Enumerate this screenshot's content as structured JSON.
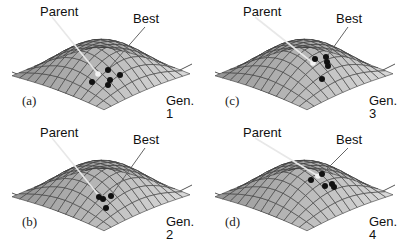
{
  "figure": {
    "panels": [
      {
        "id": "a",
        "tag": "(a)",
        "generation": "Gen. 1",
        "parent_label": "Parent",
        "best_label": "Best",
        "parent_point": [
          98,
          74
        ],
        "best_point": [
          107,
          70
        ],
        "offspring": [
          [
            92,
            82
          ],
          [
            108,
            70
          ],
          [
            110,
            80
          ],
          [
            108,
            85
          ],
          [
            120,
            75
          ]
        ]
      },
      {
        "id": "b",
        "tag": "(b)",
        "generation": "Gen. 2",
        "parent_label": "Parent",
        "best_label": "Best",
        "parent_point": [
          100,
          76
        ],
        "best_point": [
          110,
          75
        ],
        "offspring": [
          [
            99,
            76
          ],
          [
            103,
            78
          ],
          [
            111,
            75
          ],
          [
            106,
            87
          ]
        ]
      },
      {
        "id": "c",
        "tag": "(c)",
        "generation": "Gen. 3",
        "parent_label": "Parent",
        "best_label": "Best",
        "parent_point": [
          110,
          63
        ],
        "best_point": [
          122,
          58
        ],
        "offspring": [
          [
            112,
            59
          ],
          [
            123,
            57
          ],
          [
            124,
            62
          ],
          [
            125,
            66
          ],
          [
            119,
            79
          ]
        ]
      },
      {
        "id": "d",
        "tag": "(d)",
        "generation": "Gen. 4",
        "parent_label": "Parent",
        "best_label": "Best",
        "parent_point": [
          115,
          55
        ],
        "best_point": [
          119,
          53
        ],
        "offspring": [
          [
            119,
            53
          ],
          [
            108,
            59
          ],
          [
            122,
            65
          ],
          [
            129,
            63
          ],
          [
            131,
            66
          ]
        ]
      }
    ]
  },
  "colors": {
    "surface_light": "#d4d4d4",
    "surface_dark": "#8a8a8a",
    "gridline": "#3a3a3a",
    "base_line": "#555555",
    "point": "#111111",
    "pointer_line": "#e8e8e8"
  }
}
